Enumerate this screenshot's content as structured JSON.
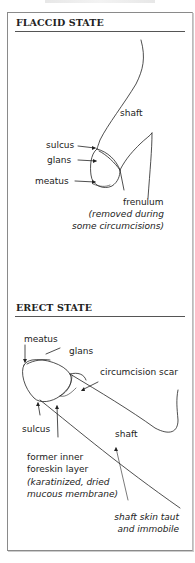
{
  "diagram": {
    "flaccid": {
      "heading": "FLACCID STATE",
      "labels": {
        "shaft": "shaft",
        "sulcus": "sulcus",
        "glans": "glans",
        "meatus": "meatus",
        "frenulum": "frenulum",
        "frenulum_note_1": "(removed during",
        "frenulum_note_2": "some circumcisions)"
      }
    },
    "erect": {
      "heading": "ERECT STATE",
      "labels": {
        "meatus": "meatus",
        "glans": "glans",
        "scar": "circumcision scar",
        "sulcus": "sulcus",
        "shaft": "shaft",
        "former_1": "former inner",
        "former_2": "foreskin layer",
        "former_note_1": "(karatinized, dried",
        "former_note_2": "mucous membrane)",
        "shaft_note_1": "shaft skin taut",
        "shaft_note_2": "and immobile"
      }
    }
  }
}
